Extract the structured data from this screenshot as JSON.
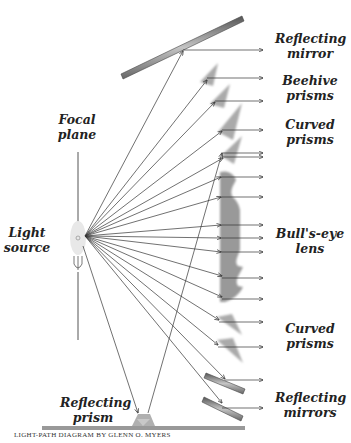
{
  "title": "Light-path diagram",
  "labels": {
    "reflecting_mirror": [
      "Reflecting",
      "mirror"
    ],
    "beehive_prisms": [
      "Beehive",
      "prisms"
    ],
    "curved_prisms_top": [
      "Curved",
      "prisms"
    ],
    "bullseye_lens": [
      "Bull's-eye",
      "lens"
    ],
    "curved_prisms_bottom": [
      "Curved",
      "prisms"
    ],
    "reflecting_mirrors": [
      "Reflecting",
      "mirrors"
    ],
    "focal_plane": [
      "Focal",
      "plane"
    ],
    "light_source": [
      "Light",
      "source"
    ],
    "reflecting_prism": [
      "Reflecting",
      "prism"
    ]
  },
  "credit": "LIGHT-PATH DIAGRAM BY GLENN O. MYERS",
  "colors": {
    "ray": "#333333",
    "element_gray": "#9a9a9a",
    "mirror_dark": "#555555",
    "mirror_light": "#b8b8b8",
    "source_fill": "#e6e6e6"
  },
  "geometry": {
    "source": {
      "cx": 78,
      "cy": 238,
      "rx": 8,
      "ry": 17
    },
    "fan_origin": {
      "x": 85,
      "y": 236
    },
    "arrow_tip_x": 263,
    "rays": [
      {
        "hit": [
          183,
          51
        ],
        "out_y": 50
      },
      {
        "hit": [
          207,
          80
        ],
        "out_y": 78
      },
      {
        "hit": [
          215,
          102
        ],
        "out_y": 101
      },
      {
        "hit": [
          222,
          131
        ],
        "out_y": 130
      },
      {
        "hit": [
          223,
          158
        ],
        "out_y": 157
      },
      {
        "hit": [
          221,
          177
        ],
        "out_y": 177
      },
      {
        "hit": [
          221,
          197
        ],
        "out_y": 197
      },
      {
        "hit": [
          221,
          225
        ],
        "out_y": 225
      },
      {
        "hit": [
          221,
          238
        ],
        "out_y": 238
      },
      {
        "hit": [
          221,
          252
        ],
        "out_y": 252
      },
      {
        "hit": [
          222,
          276
        ],
        "out_y": 278
      },
      {
        "hit": [
          222,
          297
        ],
        "out_y": 299
      },
      {
        "hit": [
          219,
          320
        ],
        "out_y": 322
      },
      {
        "hit": [
          218,
          345
        ],
        "out_y": 347
      },
      {
        "hit": [
          225,
          379
        ],
        "out_y": 380
      },
      {
        "hit": [
          222,
          403
        ],
        "out_y": 408
      }
    ],
    "prism_path": {
      "down_to": [
        138,
        413
      ],
      "up_from": [
        148,
        413
      ],
      "up_to": [
        222,
        153
      ],
      "out_y": 153
    }
  }
}
